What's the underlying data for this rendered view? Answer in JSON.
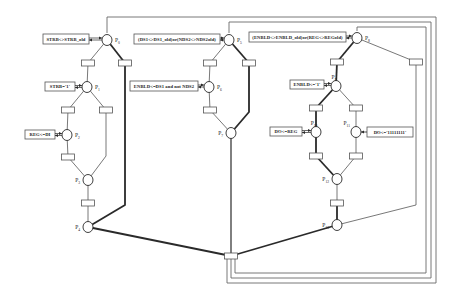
{
  "diagram": {
    "type": "petri-net",
    "colors": {
      "ink": "#2a2a2a",
      "thin": "#555555",
      "frame": "#6a6a6a",
      "fill": "#ffffff"
    },
    "places": [
      {
        "id": "P0",
        "label": "P",
        "sub": "0",
        "x": 107,
        "y": 40
      },
      {
        "id": "P1",
        "label": "P",
        "sub": "1",
        "x": 87,
        "y": 87
      },
      {
        "id": "P2",
        "label": "P",
        "sub": "2",
        "x": 67,
        "y": 135
      },
      {
        "id": "P3",
        "label": "P",
        "sub": "3",
        "x": 88,
        "y": 180,
        "labelLeft": true
      },
      {
        "id": "P4",
        "label": "P",
        "sub": "4",
        "x": 88,
        "y": 227,
        "labelLeft": true
      },
      {
        "id": "P5",
        "label": "P",
        "sub": "5",
        "x": 229,
        "y": 40
      },
      {
        "id": "P6",
        "label": "P",
        "sub": "6",
        "x": 209,
        "y": 87
      },
      {
        "id": "P7",
        "label": "P",
        "sub": "7",
        "x": 231,
        "y": 133,
        "labelLeft": true
      },
      {
        "id": "P8",
        "label": "P",
        "sub": "8",
        "x": 357,
        "y": 38
      },
      {
        "id": "P9",
        "label": "P",
        "sub": "9",
        "x": 336,
        "y": 86,
        "labelAbove": true
      },
      {
        "id": "P10",
        "label": "P",
        "sub": "10",
        "x": 316,
        "y": 132,
        "labelAbove": true
      },
      {
        "id": "P11",
        "label": "P",
        "sub": "11",
        "x": 356,
        "y": 132,
        "labelAboveLeft": true
      },
      {
        "id": "P12",
        "label": "P",
        "sub": "12",
        "x": 337,
        "y": 179,
        "labelLeft": true
      },
      {
        "id": "P13",
        "label": "P",
        "sub": "13",
        "x": 337,
        "y": 225,
        "labelLeft": true
      }
    ],
    "conditions": [
      {
        "id": "c0",
        "text": "STRB<>STRB_old",
        "x": 43,
        "y": 34,
        "w": 46,
        "h": 10,
        "place": "P0"
      },
      {
        "id": "c1",
        "text": "STRB='1'",
        "x": 45,
        "y": 82,
        "w": 30,
        "h": 9,
        "place": "P1"
      },
      {
        "id": "c2",
        "text": "REG<=DI",
        "x": 25,
        "y": 130,
        "w": 30,
        "h": 9,
        "place": "P2"
      },
      {
        "id": "c5",
        "text": "(DS1<>DS1_old)or(NDS2<>NDS2old)",
        "x": 134,
        "y": 34,
        "w": 86,
        "h": 10,
        "place": "P5"
      },
      {
        "id": "c6",
        "text": "ENBLD<=DS1 and not NDS2",
        "x": 130,
        "y": 81,
        "w": 68,
        "h": 10,
        "place": "P6"
      },
      {
        "id": "c8",
        "text": "(ENBLD<>ENBLD_old)or(REG<>REGold)",
        "x": 249,
        "y": 32,
        "w": 97,
        "h": 10,
        "place": "P8"
      },
      {
        "id": "c9",
        "text": "ENBLD<='1'",
        "x": 290,
        "y": 80,
        "w": 34,
        "h": 9,
        "place": "P9"
      },
      {
        "id": "c10",
        "text": "DO<=REG",
        "x": 270,
        "y": 127,
        "w": 32,
        "h": 9,
        "place": "P10"
      },
      {
        "id": "c11",
        "text": "DO<='11111111'",
        "x": 367,
        "y": 127,
        "w": 46,
        "h": 10,
        "place": "P11",
        "right": true
      }
    ],
    "transitions": [
      {
        "id": "t0a",
        "x": 88,
        "y": 63
      },
      {
        "id": "t0b",
        "x": 125,
        "y": 63
      },
      {
        "id": "t1a",
        "x": 68,
        "y": 110
      },
      {
        "id": "t1b",
        "x": 106,
        "y": 110
      },
      {
        "id": "t2",
        "x": 68,
        "y": 157
      },
      {
        "id": "t3",
        "x": 88,
        "y": 203
      },
      {
        "id": "t5a",
        "x": 210,
        "y": 63
      },
      {
        "id": "t5b",
        "x": 249,
        "y": 63
      },
      {
        "id": "t6",
        "x": 210,
        "y": 110
      },
      {
        "id": "t8a",
        "x": 337,
        "y": 62
      },
      {
        "id": "t8b",
        "x": 416,
        "y": 62
      },
      {
        "id": "t9a",
        "x": 316,
        "y": 108
      },
      {
        "id": "t9b",
        "x": 356,
        "y": 108
      },
      {
        "id": "t10",
        "x": 316,
        "y": 156
      },
      {
        "id": "t11",
        "x": 356,
        "y": 156
      },
      {
        "id": "t12",
        "x": 337,
        "y": 203
      },
      {
        "id": "tjoin",
        "x": 231,
        "y": 256
      }
    ],
    "arcs": [
      {
        "pts": [
          [
            107,
            40
          ],
          [
            88,
            63
          ]
        ],
        "w": 0.8
      },
      {
        "pts": [
          [
            107,
            40
          ],
          [
            125,
            63
          ]
        ],
        "w": 1.8
      },
      {
        "pts": [
          [
            88,
            63
          ],
          [
            87,
            87
          ]
        ],
        "w": 0.8
      },
      {
        "pts": [
          [
            87,
            87
          ],
          [
            68,
            110
          ]
        ],
        "w": 0.8
      },
      {
        "pts": [
          [
            87,
            87
          ],
          [
            106,
            110
          ]
        ],
        "w": 0.8
      },
      {
        "pts": [
          [
            68,
            110
          ],
          [
            67,
            135
          ]
        ],
        "w": 0.8
      },
      {
        "pts": [
          [
            67,
            135
          ],
          [
            68,
            157
          ]
        ],
        "w": 0.8
      },
      {
        "pts": [
          [
            68,
            157
          ],
          [
            88,
            180
          ]
        ],
        "w": 0.8
      },
      {
        "pts": [
          [
            106,
            110
          ],
          [
            106,
            156
          ],
          [
            88,
            180
          ]
        ],
        "w": 0.8
      },
      {
        "pts": [
          [
            88,
            180
          ],
          [
            88,
            203
          ]
        ],
        "w": 0.8
      },
      {
        "pts": [
          [
            88,
            203
          ],
          [
            88,
            227
          ]
        ],
        "w": 0.8
      },
      {
        "pts": [
          [
            125,
            63
          ],
          [
            125,
            205
          ],
          [
            88,
            227
          ]
        ],
        "w": 1.8
      },
      {
        "pts": [
          [
            88,
            227
          ],
          [
            231,
            256
          ]
        ],
        "w": 1.8
      },
      {
        "pts": [
          [
            229,
            40
          ],
          [
            210,
            63
          ]
        ],
        "w": 0.8
      },
      {
        "pts": [
          [
            229,
            40
          ],
          [
            249,
            63
          ]
        ],
        "w": 1.8
      },
      {
        "pts": [
          [
            210,
            63
          ],
          [
            209,
            87
          ]
        ],
        "w": 0.8
      },
      {
        "pts": [
          [
            209,
            87
          ],
          [
            210,
            110
          ]
        ],
        "w": 0.8
      },
      {
        "pts": [
          [
            210,
            110
          ],
          [
            231,
            133
          ]
        ],
        "w": 0.8
      },
      {
        "pts": [
          [
            249,
            63
          ],
          [
            249,
            112
          ],
          [
            231,
            133
          ]
        ],
        "w": 1.8
      },
      {
        "pts": [
          [
            231,
            133
          ],
          [
            231,
            256
          ]
        ],
        "w": 1.2
      },
      {
        "pts": [
          [
            357,
            38
          ],
          [
            337,
            62
          ]
        ],
        "w": 1.8
      },
      {
        "pts": [
          [
            357,
            38
          ],
          [
            416,
            62
          ]
        ],
        "w": 0.8
      },
      {
        "pts": [
          [
            337,
            62
          ],
          [
            336,
            86
          ]
        ],
        "w": 1.8
      },
      {
        "pts": [
          [
            336,
            86
          ],
          [
            316,
            108
          ]
        ],
        "w": 1.8
      },
      {
        "pts": [
          [
            336,
            86
          ],
          [
            356,
            108
          ]
        ],
        "w": 0.8
      },
      {
        "pts": [
          [
            316,
            108
          ],
          [
            316,
            132
          ]
        ],
        "w": 1.8
      },
      {
        "pts": [
          [
            356,
            108
          ],
          [
            356,
            132
          ]
        ],
        "w": 0.8
      },
      {
        "pts": [
          [
            316,
            132
          ],
          [
            316,
            156
          ]
        ],
        "w": 1.8
      },
      {
        "pts": [
          [
            356,
            132
          ],
          [
            356,
            156
          ]
        ],
        "w": 0.8
      },
      {
        "pts": [
          [
            316,
            156
          ],
          [
            337,
            179
          ]
        ],
        "w": 1.8
      },
      {
        "pts": [
          [
            356,
            156
          ],
          [
            337,
            179
          ]
        ],
        "w": 0.8
      },
      {
        "pts": [
          [
            337,
            179
          ],
          [
            337,
            203
          ]
        ],
        "w": 0.8
      },
      {
        "pts": [
          [
            337,
            203
          ],
          [
            337,
            225
          ]
        ],
        "w": 1.8
      },
      {
        "pts": [
          [
            416,
            62
          ],
          [
            416,
            205
          ],
          [
            337,
            225
          ]
        ],
        "w": 0.8
      },
      {
        "pts": [
          [
            337,
            225
          ],
          [
            231,
            256
          ]
        ],
        "w": 1.8
      }
    ],
    "feedback": [
      {
        "pts": [
          [
            227,
            259
          ],
          [
            227,
            283
          ],
          [
            436,
            283
          ],
          [
            436,
            17
          ],
          [
            107,
            17
          ],
          [
            107,
            33
          ]
        ]
      },
      {
        "pts": [
          [
            231,
            259
          ],
          [
            231,
            278
          ],
          [
            431,
            278
          ],
          [
            431,
            22
          ],
          [
            229,
            22
          ],
          [
            229,
            33
          ]
        ]
      },
      {
        "pts": [
          [
            235,
            259
          ],
          [
            235,
            273
          ],
          [
            426,
            273
          ],
          [
            426,
            27
          ],
          [
            357,
            27
          ],
          [
            357,
            31
          ]
        ]
      }
    ]
  }
}
